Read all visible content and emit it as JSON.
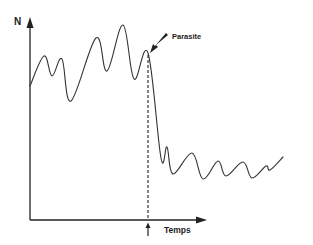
{
  "chart_data": {
    "type": "line",
    "title": "",
    "xlabel": "Temps",
    "ylabel": "N",
    "grid": false,
    "legend": null,
    "annotations": [
      {
        "text": "Parasite",
        "type": "arrow-label",
        "points_to": "peak before drop"
      },
      {
        "text": "",
        "type": "dashed-vertical-line",
        "marks": "parasite introduction time"
      },
      {
        "text": "",
        "type": "up-arrow-below-x-axis",
        "marks": "parasite introduction time"
      }
    ],
    "series": [
      {
        "name": "N",
        "description": "Population fluctuates at high level, then drops sharply after parasite introduction and fluctuates at a lower level",
        "points_px": [
          [
            30,
            86
          ],
          [
            44,
            56
          ],
          [
            52,
            76
          ],
          [
            62,
            59
          ],
          [
            71,
            101
          ],
          [
            96,
            38
          ],
          [
            107,
            71
          ],
          [
            123,
            25
          ],
          [
            134,
            79
          ],
          [
            148,
            53
          ],
          [
            161,
            158
          ],
          [
            167,
            147
          ],
          [
            173,
            174
          ],
          [
            192,
            153
          ],
          [
            203,
            179
          ],
          [
            218,
            161
          ],
          [
            226,
            176
          ],
          [
            243,
            162
          ],
          [
            252,
            178
          ],
          [
            266,
            166
          ],
          [
            270,
            170
          ],
          [
            283,
            157
          ]
        ]
      }
    ],
    "axes_px": {
      "origin": [
        30,
        220
      ],
      "y_top": 18,
      "x_right": 207
    },
    "event_x_px": 148
  },
  "labels": {
    "y_axis": "N",
    "x_axis": "Temps",
    "annotation": "Parasite"
  },
  "colors": {
    "line": "#333333",
    "axis": "#222222",
    "background": "#ffffff"
  }
}
